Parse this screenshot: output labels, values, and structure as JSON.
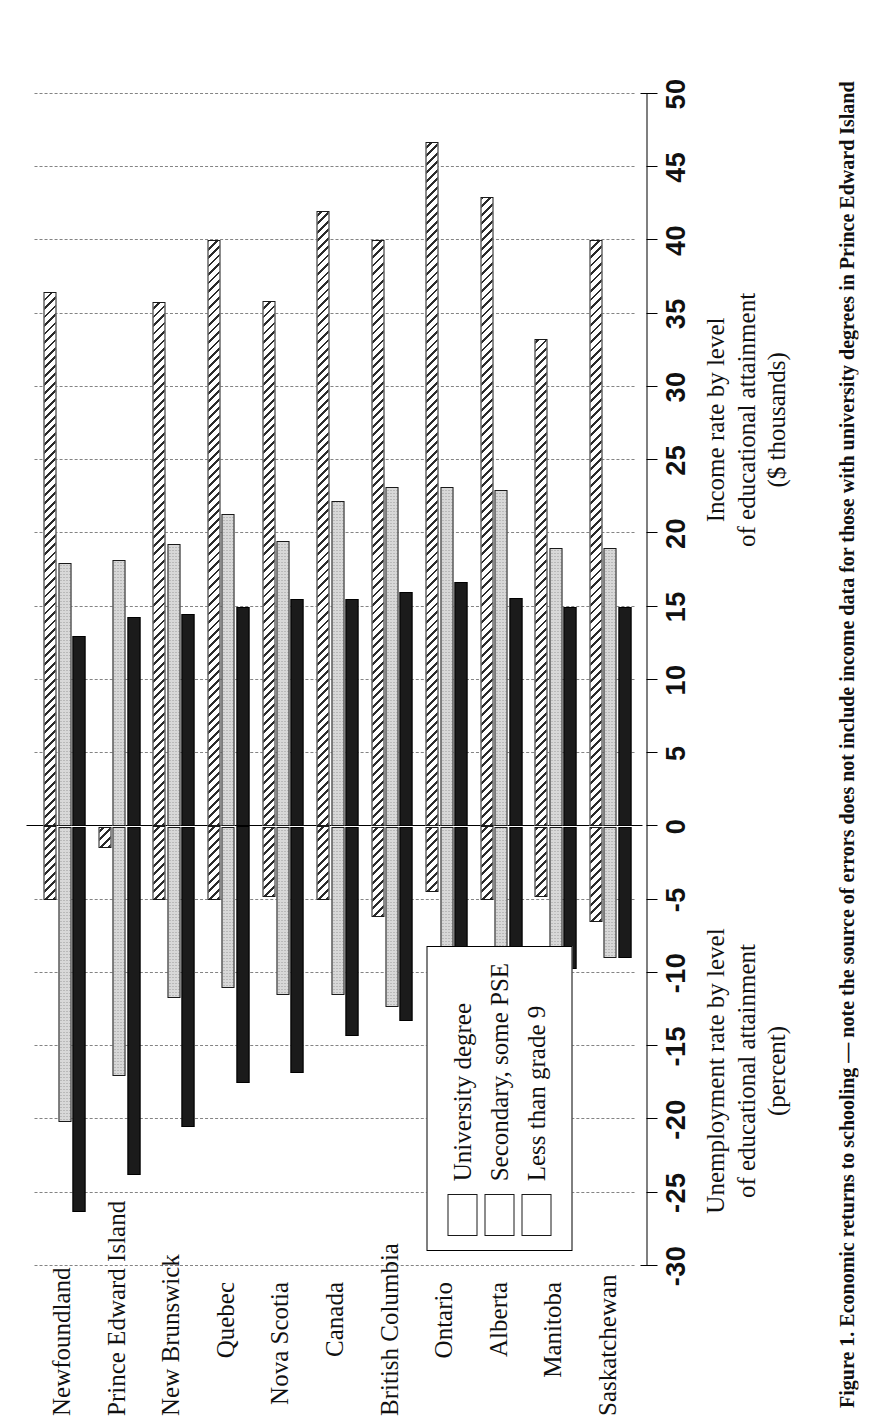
{
  "figure": {
    "caption": "Figure 1. Economic returns to schooling — note the source of errors does not include income data for those with university degrees in Prince Edward Island"
  },
  "axis": {
    "title_positive": "Income rate by level\nof educational attainment\n($ thousands)",
    "title_positive_lines": [
      "Income rate by level",
      "of educational attainment",
      "($ thousands)"
    ],
    "title_negative": "Unemployment rate by level\nof educational attainment\n(percent)",
    "title_negative_lines": [
      "Unemployment rate by level",
      "of educational attainment",
      "(percent)"
    ],
    "tick_labels": [
      "-30",
      "-25",
      "-20",
      "-15",
      "-10",
      "-5",
      "0",
      "5",
      "10",
      "15",
      "20",
      "25",
      "30",
      "35",
      "40",
      "45",
      "50"
    ],
    "min": -30,
    "max": 50,
    "step": 5
  },
  "legend": {
    "items": [
      {
        "label": "University degree",
        "pattern": "diagonal-hatch",
        "swatch_name": "legend-swatch-university"
      },
      {
        "label": "Secondary, some PSE",
        "pattern": "stipple-gray",
        "swatch_name": "legend-swatch-secondary"
      },
      {
        "label": "Less than grade 9",
        "pattern": "solid-black",
        "swatch_name": "legend-swatch-less-grade9"
      }
    ]
  },
  "colors": {
    "axis": "#000000",
    "grid": "#6f6f6f",
    "less_than_grade9": "#1b1b1b",
    "secondary_some_pse": "#d8d8d8",
    "university_degree": "#ffffff"
  },
  "chart_data": {
    "type": "bar",
    "title": "",
    "subtitle": "",
    "orientation": "horizontal-diverging",
    "xlabel": "Income rate by level of educational attainment ($ thousands)",
    "ylabel": "",
    "xlim": [
      -30,
      50
    ],
    "grid": true,
    "legend_position": "inside-bottom-right",
    "categories": [
      "Newfoundland",
      "Prince Edward Island",
      "New Brunswick",
      "Quebec",
      "Nova Scotia",
      "Canada",
      "British Columbia",
      "Ontario",
      "Alberta",
      "Manitoba",
      "Saskatchewan"
    ],
    "series": [
      {
        "name": "University degree",
        "income": [
          36.5,
          null,
          35.8,
          40.0,
          35.9,
          42.0,
          40.0,
          46.7,
          43.0,
          33.3,
          40.0
        ],
        "unemployment": [
          -5.0,
          -1.5,
          -5.0,
          -5.0,
          -4.8,
          -5.0,
          -6.2,
          -4.5,
          -5.0,
          -4.8,
          -6.5
        ]
      },
      {
        "name": "Secondary, some PSE",
        "income": [
          18.0,
          18.2,
          19.3,
          21.3,
          19.5,
          22.2,
          23.2,
          23.2,
          23.0,
          19.0,
          19.0
        ],
        "unemployment": [
          -20.2,
          -17.0,
          -11.7,
          -11.0,
          -11.5,
          -11.5,
          -12.3,
          -10.3,
          -9.3,
          -10.3,
          -9.0
        ]
      },
      {
        "name": "Less than grade 9",
        "income": [
          13.0,
          14.3,
          14.5,
          15.0,
          15.5,
          15.5,
          16.0,
          16.7,
          15.6,
          15.0,
          15.0
        ],
        "unemployment": [
          -26.3,
          -23.8,
          -20.5,
          -17.5,
          -16.8,
          -14.3,
          -13.3,
          -12.7,
          -11.8,
          -9.7,
          -9.0
        ]
      }
    ]
  }
}
